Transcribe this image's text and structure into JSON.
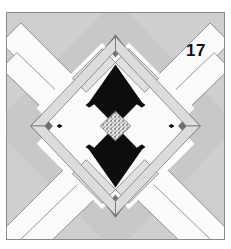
{
  "figure": {
    "kind": "quilt-block-diagram",
    "label": "17",
    "canvas": {
      "width": 231,
      "height": 249,
      "background": "#ffffff"
    },
    "block": {
      "x": 6,
      "y": 12,
      "width": 219,
      "height": 228,
      "border_color": "#8a8a8a",
      "background_color": "#c8c8c8"
    },
    "palette": {
      "background_gray": "#c8c8c8",
      "light_gray": "#d2d2d2",
      "white_sashing": "#fbfbfb",
      "pale_strip": "#e3e3e3",
      "medium_gray": "#9b9b9b",
      "dark_gray": "#6e6e6e",
      "black": "#0d0d0d",
      "speckle_base": "#e8e8e8",
      "speckle_dot": "#6b6b6b",
      "outline": "#6a6a6a",
      "label_color": "#111111"
    }
  }
}
